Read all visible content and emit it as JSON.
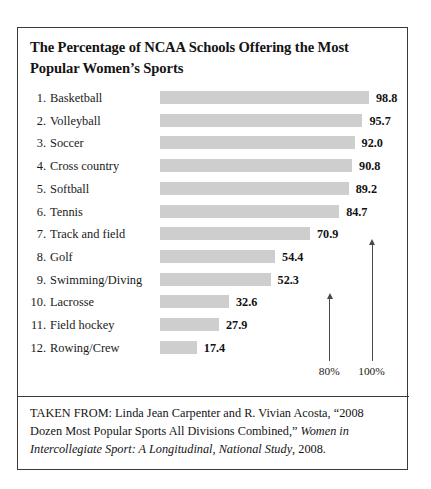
{
  "card": {
    "title": "The Percentage of NCAA Schools Offering the Most Popular Women’s Sports"
  },
  "chart_data": {
    "type": "bar",
    "orientation": "horizontal",
    "title": "The Percentage of NCAA Schools Offering the Most Popular Women’s Sports",
    "xlabel": "",
    "ylabel": "",
    "xlim": [
      0,
      100
    ],
    "grid": false,
    "legend": false,
    "value_labels": true,
    "bar_color": "#cecece",
    "categories": [
      "Basketball",
      "Volleyball",
      "Soccer",
      "Cross country",
      "Softball",
      "Tennis",
      "Track and field",
      "Golf",
      "Swimming/Diving",
      "Lacrosse",
      "Field hockey",
      "Rowing/Crew"
    ],
    "values": [
      98.8,
      95.7,
      92.0,
      90.8,
      89.2,
      84.7,
      70.9,
      54.4,
      52.3,
      32.6,
      27.9,
      17.4
    ],
    "ranks": [
      "1.",
      "2.",
      "3.",
      "4.",
      "5.",
      "6.",
      "7.",
      "8.",
      "9.",
      "10.",
      "11.",
      "12."
    ],
    "axis_marks": [
      {
        "label": "80%",
        "value": 80
      },
      {
        "label": "100%",
        "value": 100
      }
    ]
  },
  "source": {
    "prefix": "TAKEN FROM: Linda Jean Carpenter and R. Vivian Acosta, “2008 Dozen Most Popular Sports All Divisions Combined,” ",
    "italic": "Women in Intercollegiate Sport: A Longitudinal, National Study",
    "suffix": ", 2008."
  }
}
